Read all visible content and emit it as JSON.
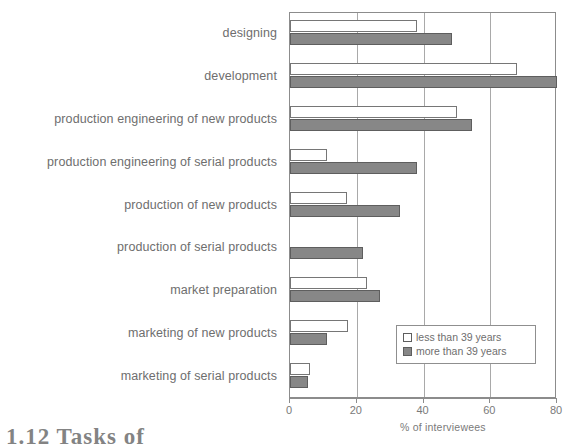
{
  "chart_data": {
    "type": "bar",
    "orientation": "horizontal",
    "title": "",
    "xlabel": "% of interviewees",
    "ylabel": "",
    "xlim": [
      0,
      80
    ],
    "xticks": [
      0,
      20,
      40,
      60,
      80
    ],
    "xtick_labels": [
      "0",
      "20",
      "40",
      "60",
      "80"
    ],
    "grid": true,
    "grid_axis": "x",
    "legend_position": "lower right",
    "categories": [
      "designing",
      "development",
      "production engineering of new products",
      "production engineering of serial products",
      "production of new products",
      "production of serial products",
      "market preparation",
      "marketing of new products",
      "marketing of serial products"
    ],
    "series": [
      {
        "name": "less than 39 years",
        "color": "#ffffff",
        "values": [
          38,
          68,
          50,
          11,
          17,
          0,
          23,
          17.5,
          6
        ]
      },
      {
        "name": "more than 39 years",
        "color": "#878787",
        "values": [
          48.5,
          80,
          54.5,
          38,
          33,
          22,
          27,
          11,
          5.5
        ]
      }
    ]
  },
  "axis": {
    "x_title": "% of interviewees"
  },
  "legend": {
    "entries": [
      {
        "label": "less than 39 years",
        "swatch": "legend-swatch-light"
      },
      {
        "label": "more than 39 years",
        "swatch": "legend-swatch-dark"
      }
    ]
  },
  "caption": {
    "fragment": "1.12  Tasks of"
  }
}
